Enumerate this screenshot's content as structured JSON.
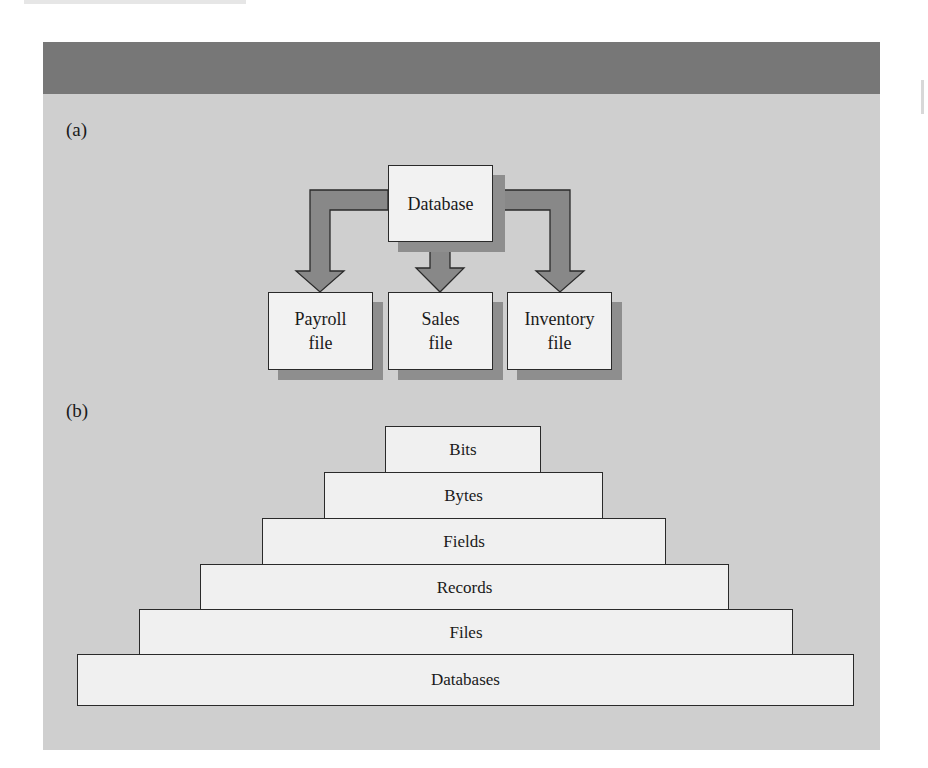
{
  "figure": {
    "header_band_color": "#777777",
    "panel_color": "#cfcfcf",
    "box_fill": "#f2f2f2",
    "arrow_fill": "#888888"
  },
  "panel_a": {
    "label": "(a)",
    "source": {
      "label": "Database"
    },
    "targets": [
      {
        "line1": "Payroll",
        "line2": "file"
      },
      {
        "line1": "Sales",
        "line2": "file"
      },
      {
        "line1": "Inventory",
        "line2": "file"
      }
    ]
  },
  "panel_b": {
    "label": "(b)",
    "tiers": [
      {
        "label": "Bits"
      },
      {
        "label": "Bytes"
      },
      {
        "label": "Fields"
      },
      {
        "label": "Records"
      },
      {
        "label": "Files"
      },
      {
        "label": "Databases"
      }
    ]
  }
}
